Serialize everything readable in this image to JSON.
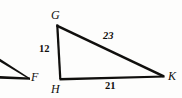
{
  "figure": {
    "type": "geometry-diagram",
    "background_color": "#fdfdfc",
    "stroke_color": "#100f0d",
    "text_color": "#100f0d",
    "triangle": {
      "name": "GHK",
      "vertices": [
        {
          "id": "G",
          "label": "G",
          "x": 57,
          "y": 25
        },
        {
          "id": "H",
          "label": "H",
          "x": 60,
          "y": 79
        },
        {
          "id": "K",
          "label": "K",
          "x": 164,
          "y": 76
        }
      ],
      "sides": [
        {
          "id": "GH",
          "from": "G",
          "to": "H",
          "measure": "12"
        },
        {
          "id": "GK",
          "from": "G",
          "to": "K",
          "measure": "23"
        },
        {
          "id": "HK",
          "from": "H",
          "to": "K",
          "measure": "21"
        }
      ]
    },
    "partial_figure": {
      "vertex": {
        "id": "F",
        "label": "F",
        "x": 30,
        "y": 78
      }
    }
  }
}
